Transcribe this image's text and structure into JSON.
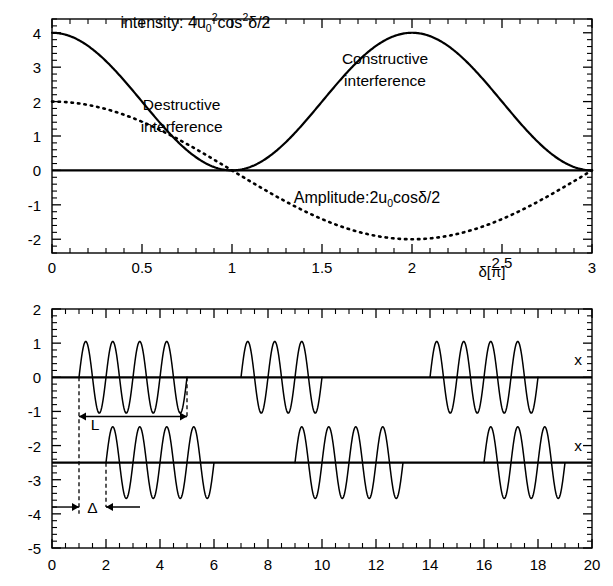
{
  "figure": {
    "name": "interference-figure",
    "background": "#ffffff",
    "ink": "#000000"
  },
  "chart_data": [
    {
      "type": "line",
      "panel": "top",
      "title": "",
      "xlabel": "δ[π]",
      "ylabel": "",
      "xlim": [
        0,
        3
      ],
      "ylim": [
        -2.4,
        4.4
      ],
      "xticks": [
        0,
        0.5,
        1,
        1.5,
        2,
        2.5,
        3
      ],
      "xticklabels": [
        "0",
        "0.5",
        "1",
        "1.5",
        "2",
        "2.5",
        "3"
      ],
      "yticks": [
        -2,
        -1,
        0,
        1,
        2,
        3,
        4
      ],
      "yticklabels": [
        "-2",
        "-1",
        "0",
        "1",
        "2",
        "3",
        "4"
      ],
      "grid": false,
      "legend": "inline-annotations",
      "series": [
        {
          "name": "intensity",
          "style": "solid",
          "formula": "4 u0^2 cos^2(delta/2)",
          "amplitude": 4,
          "period_in_pi": 2,
          "points_x": [
            0,
            0.25,
            0.5,
            0.75,
            1.0,
            1.25,
            1.5,
            1.75,
            2.0,
            2.25,
            2.5,
            2.75,
            3.0
          ],
          "points_y": [
            4.0,
            3.41,
            2.0,
            0.59,
            0.0,
            0.59,
            2.0,
            3.41,
            4.0,
            3.41,
            2.0,
            0.59,
            0.0
          ]
        },
        {
          "name": "amplitude",
          "style": "dotted",
          "formula": "2 u0 cos(delta/2)",
          "amplitude": 2,
          "period_in_pi": 4,
          "points_x": [
            0,
            0.25,
            0.5,
            0.75,
            1.0,
            1.25,
            1.5,
            1.75,
            2.0,
            2.25,
            2.5,
            2.75,
            3.0
          ],
          "points_y": [
            2.0,
            1.85,
            1.41,
            0.77,
            0.0,
            -0.77,
            -1.41,
            -1.85,
            -2.0,
            -1.85,
            -1.41,
            -0.77,
            0.0
          ]
        }
      ],
      "annotations": [
        {
          "id": "intensity-formula",
          "text": "intensity:",
          "math": "4u₀²cos²δ/2",
          "x": 0.38,
          "y": 4.15
        },
        {
          "id": "destructive-label",
          "line1": "Destructive",
          "line2": "interference",
          "x": 0.72,
          "y": 1.75
        },
        {
          "id": "constructive-label",
          "line1": "Constructive",
          "line2": "interference",
          "x": 1.85,
          "y": 3.1
        },
        {
          "id": "amplitude-formula",
          "text": "Amplitude:",
          "math": "2u₀cosδ/2",
          "x": 1.75,
          "y": -0.95
        }
      ]
    },
    {
      "type": "line",
      "panel": "bottom",
      "title": "",
      "xlabel": "",
      "ylabel": "",
      "xlim": [
        0,
        20
      ],
      "ylim": [
        -5,
        2
      ],
      "xticks": [
        0,
        2,
        4,
        6,
        8,
        10,
        12,
        14,
        16,
        18,
        20
      ],
      "xticklabels": [
        "0",
        "2",
        "4",
        "6",
        "8",
        "10",
        "12",
        "14",
        "16",
        "18",
        "20"
      ],
      "yticks": [
        -5,
        -4,
        -3,
        -2,
        -1,
        0,
        1,
        2
      ],
      "yticklabels": [
        "-5",
        "-4",
        "-3",
        "-2",
        "-1",
        "0",
        "1",
        "2"
      ],
      "grid": false,
      "traces": [
        {
          "name": "upper-wavetrain",
          "baseline_y": 0,
          "axis_label": "x",
          "wave_amplitude": 1,
          "wavelength": 1,
          "packets": [
            {
              "start": 1,
              "end": 5,
              "cycles": 4
            },
            {
              "start": 7,
              "end": 10,
              "cycles": 3
            },
            {
              "start": 14,
              "end": 18,
              "cycles": 4
            }
          ]
        },
        {
          "name": "lower-wavetrain",
          "baseline_y": -2.5,
          "axis_label": "x",
          "wave_amplitude": 1,
          "wavelength": 1,
          "packets": [
            {
              "start": 2,
              "end": 6,
              "cycles": 4
            },
            {
              "start": 9,
              "end": 13,
              "cycles": 4
            },
            {
              "start": 16,
              "end": 19,
              "cycles": 3
            }
          ]
        }
      ],
      "annotations": [
        {
          "id": "coherence-length-L",
          "text": "L",
          "from_x": 1,
          "to_x": 5,
          "y": -1.15,
          "kind": "double-arrow-outward"
        },
        {
          "id": "path-difference-delta",
          "text": "Δ",
          "from_x": 1,
          "to_x": 2,
          "y": -3.8,
          "kind": "double-arrow-inward"
        }
      ],
      "guides": [
        {
          "id": "guide-x1",
          "x": 1,
          "y_top": 0,
          "y_bottom": -4
        },
        {
          "id": "guide-x5",
          "x": 5,
          "y_top": 0,
          "y_bottom": -1.15
        },
        {
          "id": "guide-x2",
          "x": 2,
          "y_top": -2.5,
          "y_bottom": -3.8
        }
      ]
    }
  ]
}
